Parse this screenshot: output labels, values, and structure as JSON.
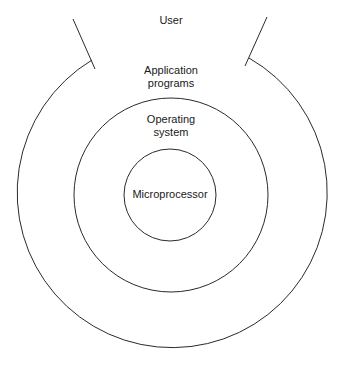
{
  "diagram": {
    "type": "concentric-layers",
    "stroke_color": "#2a2a2a",
    "layers": [
      {
        "id": "user",
        "label": "User"
      },
      {
        "id": "application",
        "label": "Application\nprograms"
      },
      {
        "id": "os",
        "label": "Operating\nsystem"
      },
      {
        "id": "cpu",
        "label": "Microprocessor"
      }
    ]
  }
}
